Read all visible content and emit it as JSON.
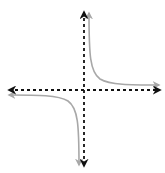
{
  "diagram": {
    "title": "",
    "axes": {
      "color": "#111111",
      "style": "dashed",
      "x_axis": {
        "y": 90,
        "x1": 8,
        "x2": 160,
        "arrows": "both"
      },
      "y_axis": {
        "x": 84,
        "y1": 12,
        "y2": 166,
        "arrows": "both"
      }
    },
    "curves": {
      "color": "#a8a8a8",
      "branches": [
        {
          "name": "quadrant-I-branch",
          "arrows": "both"
        },
        {
          "name": "quadrant-III-branch",
          "arrows": "both"
        }
      ]
    },
    "labels": []
  }
}
